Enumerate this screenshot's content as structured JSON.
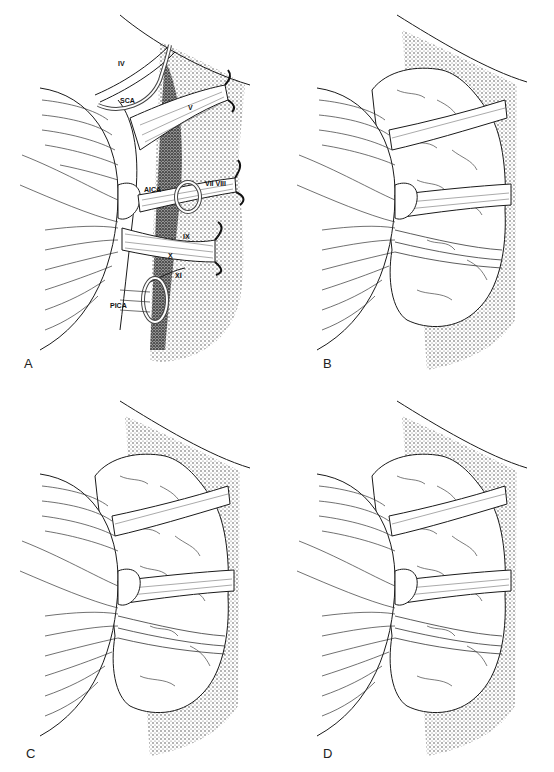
{
  "figure": {
    "panels": [
      {
        "id": "A",
        "label": "A",
        "annotations": [
          {
            "text": "IV",
            "x": 120,
            "y": 85
          },
          {
            "text": "SCA",
            "x": 122,
            "y": 105
          },
          {
            "text": "V",
            "x": 188,
            "y": 112
          },
          {
            "text": "AICA",
            "x": 145,
            "y": 193
          },
          {
            "text": "VII VIII",
            "x": 210,
            "y": 186
          },
          {
            "text": "IX",
            "x": 183,
            "y": 239
          },
          {
            "text": "X",
            "x": 168,
            "y": 257
          },
          {
            "text": "XI",
            "x": 175,
            "y": 276
          },
          {
            "text": "PICA",
            "x": 110,
            "y": 306
          }
        ]
      },
      {
        "id": "B",
        "label": "B"
      },
      {
        "id": "C",
        "label": "C"
      },
      {
        "id": "D",
        "label": "D"
      }
    ],
    "colors": {
      "ink": "#1a1a1a",
      "shade": "#3a3a3a",
      "paper": "#ffffff"
    }
  }
}
